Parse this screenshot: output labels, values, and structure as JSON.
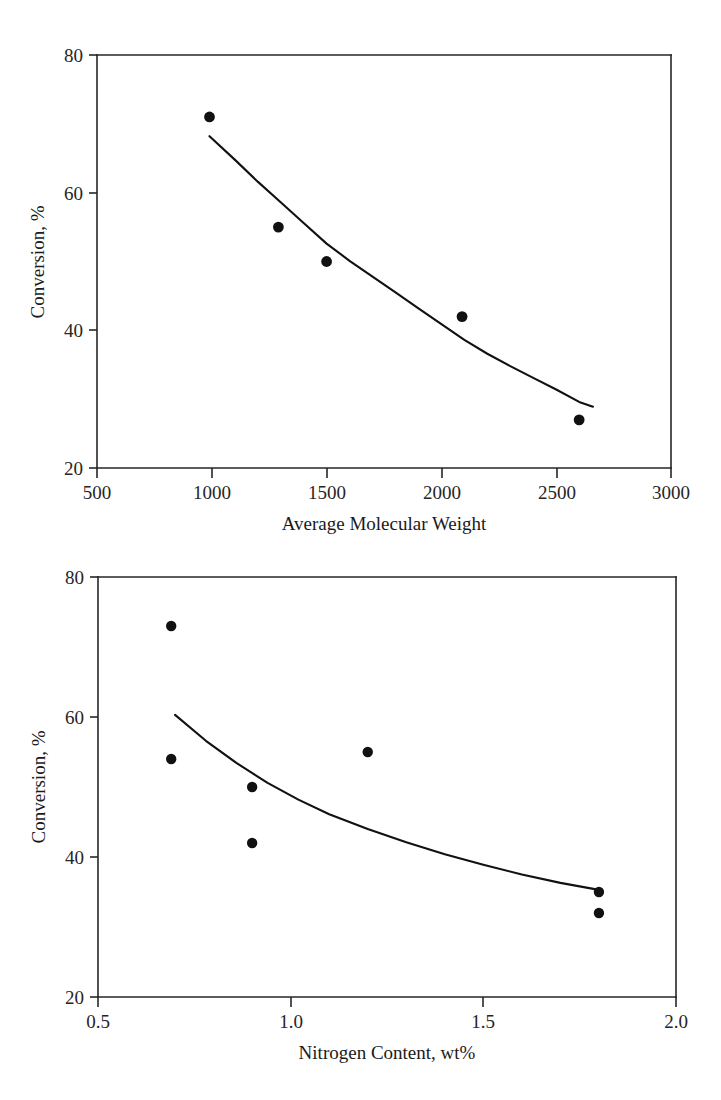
{
  "page": {
    "background": "#ffffff",
    "ink_color": "#111111",
    "width": 721,
    "height": 1100
  },
  "chart_data": [
    {
      "id": "conversion-vs-molecular-weight",
      "type": "scatter",
      "title": "",
      "xlabel": "Average Molecular Weight",
      "ylabel": "Conversion, %",
      "xlim": [
        500,
        3000
      ],
      "ylim": [
        20,
        80
      ],
      "xticks": [
        500,
        1000,
        1500,
        2000,
        2500,
        3000
      ],
      "xtick_labels": [
        "500",
        "1000",
        "1500",
        "2000",
        "2500",
        "3000"
      ],
      "yticks": [
        20,
        40,
        60,
        80
      ],
      "ytick_labels": [
        "20",
        "40",
        "60",
        "80"
      ],
      "grid": false,
      "legend": "none",
      "marker": "filled-circle",
      "points": [
        {
          "x": 990,
          "y": 71
        },
        {
          "x": 1290,
          "y": 55
        },
        {
          "x": 1500,
          "y": 50
        },
        {
          "x": 2090,
          "y": 42
        },
        {
          "x": 2600,
          "y": 27
        }
      ],
      "series": [
        {
          "name": "trend",
          "style": "solid-line",
          "x": [
            990,
            1100,
            1200,
            1300,
            1400,
            1500,
            1600,
            1700,
            1800,
            1900,
            2000,
            2100,
            2200,
            2300,
            2400,
            2500,
            2600,
            2660
          ],
          "y": [
            68.2,
            64.8,
            61.6,
            58.6,
            55.6,
            52.6,
            50.1,
            47.8,
            45.5,
            43.2,
            40.9,
            38.6,
            36.6,
            34.8,
            33.1,
            31.4,
            29.6,
            28.9
          ]
        }
      ]
    },
    {
      "id": "conversion-vs-nitrogen-content",
      "type": "scatter",
      "title": "",
      "xlabel": "Nitrogen Content, wt%",
      "ylabel": "Conversion, %",
      "xlim": [
        0.5,
        2.0
      ],
      "ylim": [
        20,
        80
      ],
      "xticks": [
        0.5,
        1.0,
        1.5,
        2.0
      ],
      "xtick_labels": [
        "0.5",
        "1.0",
        "1.5",
        "2.0"
      ],
      "yticks": [
        20,
        40,
        60,
        80
      ],
      "ytick_labels": [
        "20",
        "40",
        "60",
        "80"
      ],
      "grid": false,
      "legend": "none",
      "marker": "filled-circle",
      "points": [
        {
          "x": 0.69,
          "y": 73
        },
        {
          "x": 0.69,
          "y": 54
        },
        {
          "x": 0.9,
          "y": 50
        },
        {
          "x": 0.9,
          "y": 42
        },
        {
          "x": 1.2,
          "y": 55
        },
        {
          "x": 1.8,
          "y": 35
        },
        {
          "x": 1.8,
          "y": 32
        }
      ],
      "series": [
        {
          "name": "trend",
          "style": "solid-line",
          "x": [
            0.7,
            0.78,
            0.86,
            0.94,
            1.02,
            1.1,
            1.2,
            1.3,
            1.4,
            1.5,
            1.6,
            1.7,
            1.8
          ],
          "y": [
            60.3,
            56.6,
            53.4,
            50.6,
            48.2,
            46.1,
            44.0,
            42.1,
            40.4,
            38.9,
            37.5,
            36.3,
            35.3
          ]
        }
      ]
    }
  ]
}
